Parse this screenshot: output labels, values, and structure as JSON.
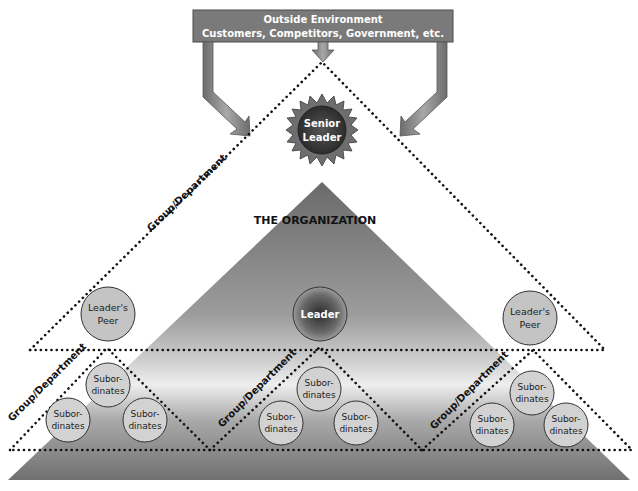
{
  "environment_box": {
    "line1": "Outside Environment",
    "line2": "Customers, Competitors, Government, etc."
  },
  "senior_leader": {
    "line1": "Senior",
    "line2": "Leader"
  },
  "organization_title": "THE ORGANIZATION",
  "leader": "Leader",
  "leaders_peer": {
    "line1": "Leader's",
    "line2": "Peer"
  },
  "group_label": "Group/Department",
  "subordinates": {
    "line1": "Subor-",
    "line2": "dinates"
  },
  "colors": {
    "box_fill": "#7a7a7a",
    "arrow_fill": "#8a8a8a",
    "starburst": "#6e6e6e",
    "senior_circle": "#3a3a3a",
    "circle_fill": "#c8c8c8",
    "dots": "#111111"
  }
}
